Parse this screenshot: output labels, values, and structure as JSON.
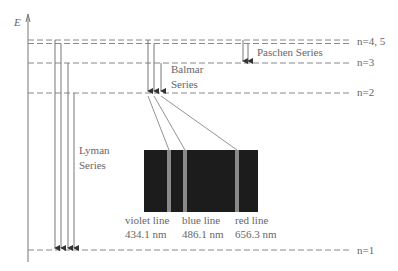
{
  "axis": {
    "label": "E"
  },
  "levels": [
    {
      "name": "n=4, 5",
      "label": "n=4, 5"
    },
    {
      "name": "n=3",
      "label": "n=3"
    },
    {
      "name": "n=2",
      "label": "n=2"
    },
    {
      "name": "n=1",
      "label": "n=1"
    }
  ],
  "series": {
    "lyman": {
      "line1": "Lyman",
      "line2": "Series"
    },
    "balmer": {
      "line1": "Balmar",
      "line2": "Series"
    },
    "paschen": {
      "line1": "Paschen Series"
    }
  },
  "spectrum": {
    "lines": [
      {
        "name": "violet line",
        "wavelength": "434.1 nm",
        "color": "#8a8a8a"
      },
      {
        "name": "blue line",
        "wavelength": "486.1 nm",
        "color": "#8a8a8a"
      },
      {
        "name": "red line",
        "wavelength": "656.3 nm",
        "color": "#8a8a8a"
      }
    ],
    "background": "#1c1c1c"
  }
}
